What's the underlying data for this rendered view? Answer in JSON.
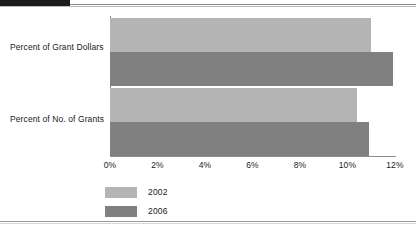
{
  "chart_data": {
    "type": "bar",
    "orientation": "horizontal",
    "title": "",
    "xlabel": "",
    "ylabel": "",
    "categories": [
      "Percent of Grant Dollars",
      "Percent of No. of Grants"
    ],
    "series": [
      {
        "name": "2002",
        "color": "#b4b4b4",
        "values": [
          11.0,
          10.4
        ]
      },
      {
        "name": "2006",
        "color": "#808080",
        "values": [
          11.9,
          10.9
        ]
      }
    ],
    "xlim": [
      0,
      12
    ],
    "xticks": [
      0,
      2,
      4,
      6,
      8,
      10,
      12
    ],
    "xtick_labels": [
      "0%",
      "2%",
      "4%",
      "6%",
      "8%",
      "10%",
      "12%"
    ],
    "grid": false,
    "legend_position": "bottom-left",
    "legend_entries": [
      "2002",
      "2006"
    ]
  },
  "axis": {
    "line_color": "#8d8d8d"
  },
  "frame": {
    "tab_color": "#1c1c1c",
    "rule_color": "#9a9a9a",
    "background": "#ffffff"
  }
}
